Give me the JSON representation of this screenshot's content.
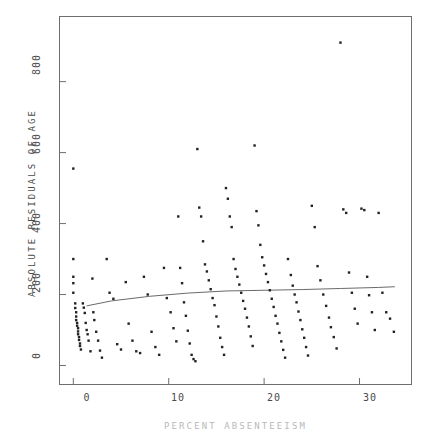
{
  "figure": {
    "background_color": "#ffffff",
    "foreground_color": "#3a3a3a",
    "frame_color": "#6e6e6e"
  },
  "axis_titles": {
    "y": "ABSOLUTE  RESIDUALS  OF  AGE",
    "x": "PERCENT  ABSENTEEISM"
  },
  "ticks": {
    "y_labels": [
      "0",
      "200",
      "400",
      "600",
      "800"
    ],
    "x_labels": [
      "0",
      "10",
      "20",
      "30"
    ]
  },
  "chart_data": {
    "type": "scatter",
    "title": "",
    "xlabel": "PERCENT  ABSENTEEISM",
    "ylabel": "ABSOLUTE  RESIDUALS  OF  AGE",
    "xlim": [
      -1.5,
      35.5
    ],
    "ylim": [
      -55,
      985
    ],
    "xticks": [
      0,
      10,
      20,
      30
    ],
    "yticks": [
      0,
      200,
      400,
      600,
      800
    ],
    "grid": false,
    "legend": null,
    "marker": "square",
    "marker_color": "#222222",
    "marker_size_px": 2.4,
    "series": [
      {
        "name": "Absolute residuals",
        "points": [
          [
            0.0,
            555
          ],
          [
            0.0,
            300
          ],
          [
            0.0,
            250
          ],
          [
            0.0,
            232
          ],
          [
            0.0,
            205
          ],
          [
            0.2,
            175
          ],
          [
            0.2,
            162
          ],
          [
            0.3,
            150
          ],
          [
            0.3,
            138
          ],
          [
            0.3,
            128
          ],
          [
            0.4,
            120
          ],
          [
            0.4,
            112
          ],
          [
            0.5,
            105
          ],
          [
            0.5,
            96
          ],
          [
            0.5,
            88
          ],
          [
            0.6,
            80
          ],
          [
            0.6,
            72
          ],
          [
            0.7,
            62
          ],
          [
            0.7,
            55
          ],
          [
            0.8,
            45
          ],
          [
            1.0,
            175
          ],
          [
            1.1,
            163
          ],
          [
            1.2,
            148
          ],
          [
            1.3,
            120
          ],
          [
            1.4,
            100
          ],
          [
            1.5,
            88
          ],
          [
            1.6,
            70
          ],
          [
            1.8,
            40
          ],
          [
            2.0,
            245
          ],
          [
            2.1,
            150
          ],
          [
            2.2,
            128
          ],
          [
            2.4,
            95
          ],
          [
            2.6,
            70
          ],
          [
            2.8,
            42
          ],
          [
            3.0,
            22
          ],
          [
            3.5,
            300
          ],
          [
            3.8,
            205
          ],
          [
            4.2,
            188
          ],
          [
            4.6,
            60
          ],
          [
            5.0,
            45
          ],
          [
            5.5,
            235
          ],
          [
            5.8,
            118
          ],
          [
            6.2,
            70
          ],
          [
            6.6,
            40
          ],
          [
            7.0,
            35
          ],
          [
            7.4,
            250
          ],
          [
            7.8,
            200
          ],
          [
            8.2,
            95
          ],
          [
            8.6,
            52
          ],
          [
            9.0,
            30
          ],
          [
            9.5,
            275
          ],
          [
            9.8,
            190
          ],
          [
            10.2,
            150
          ],
          [
            10.5,
            105
          ],
          [
            10.8,
            68
          ],
          [
            11.0,
            420
          ],
          [
            11.2,
            275
          ],
          [
            11.4,
            232
          ],
          [
            11.6,
            178
          ],
          [
            11.8,
            140
          ],
          [
            12.0,
            98
          ],
          [
            12.2,
            62
          ],
          [
            12.4,
            30
          ],
          [
            12.6,
            18
          ],
          [
            12.8,
            12
          ],
          [
            13.0,
            610
          ],
          [
            13.2,
            445
          ],
          [
            13.4,
            420
          ],
          [
            13.6,
            350
          ],
          [
            13.8,
            285
          ],
          [
            14.0,
            265
          ],
          [
            14.2,
            240
          ],
          [
            14.4,
            215
          ],
          [
            14.6,
            190
          ],
          [
            14.8,
            170
          ],
          [
            15.0,
            138
          ],
          [
            15.2,
            110
          ],
          [
            15.4,
            78
          ],
          [
            15.6,
            52
          ],
          [
            15.8,
            30
          ],
          [
            16.0,
            500
          ],
          [
            16.2,
            470
          ],
          [
            16.4,
            420
          ],
          [
            16.6,
            390
          ],
          [
            16.8,
            300
          ],
          [
            17.0,
            272
          ],
          [
            17.2,
            250
          ],
          [
            17.4,
            228
          ],
          [
            17.6,
            205
          ],
          [
            17.8,
            182
          ],
          [
            18.0,
            160
          ],
          [
            18.2,
            135
          ],
          [
            18.4,
            110
          ],
          [
            18.6,
            82
          ],
          [
            18.8,
            55
          ],
          [
            19.0,
            620
          ],
          [
            19.2,
            435
          ],
          [
            19.4,
            395
          ],
          [
            19.6,
            340
          ],
          [
            19.8,
            305
          ],
          [
            20.0,
            282
          ],
          [
            20.2,
            258
          ],
          [
            20.4,
            235
          ],
          [
            20.6,
            212
          ],
          [
            20.8,
            188
          ],
          [
            21.0,
            165
          ],
          [
            21.2,
            140
          ],
          [
            21.4,
            118
          ],
          [
            21.6,
            92
          ],
          [
            21.8,
            68
          ],
          [
            22.0,
            44
          ],
          [
            22.2,
            22
          ],
          [
            22.5,
            300
          ],
          [
            22.8,
            255
          ],
          [
            23.0,
            225
          ],
          [
            23.2,
            200
          ],
          [
            23.4,
            178
          ],
          [
            23.6,
            152
          ],
          [
            23.8,
            128
          ],
          [
            24.0,
            102
          ],
          [
            24.2,
            78
          ],
          [
            24.4,
            52
          ],
          [
            24.6,
            28
          ],
          [
            25.0,
            450
          ],
          [
            25.3,
            390
          ],
          [
            25.6,
            280
          ],
          [
            25.9,
            240
          ],
          [
            26.2,
            200
          ],
          [
            26.5,
            168
          ],
          [
            26.8,
            135
          ],
          [
            27.0,
            108
          ],
          [
            27.3,
            80
          ],
          [
            27.6,
            48
          ],
          [
            28.0,
            910
          ],
          [
            28.3,
            440
          ],
          [
            28.6,
            430
          ],
          [
            28.9,
            262
          ],
          [
            29.2,
            205
          ],
          [
            29.5,
            160
          ],
          [
            29.8,
            118
          ],
          [
            30.2,
            442
          ],
          [
            30.5,
            438
          ],
          [
            30.8,
            250
          ],
          [
            31.0,
            198
          ],
          [
            31.3,
            150
          ],
          [
            31.6,
            100
          ],
          [
            32.0,
            430
          ],
          [
            32.4,
            205
          ],
          [
            32.8,
            150
          ],
          [
            33.2,
            132
          ],
          [
            33.6,
            95
          ]
        ]
      }
    ],
    "trend_line": {
      "name": "lowess-fit",
      "color": "#6a6a6a",
      "points": [
        [
          1.4,
          168
        ],
        [
          4.0,
          182
        ],
        [
          8.0,
          195
        ],
        [
          12.0,
          204
        ],
        [
          16.0,
          210
        ],
        [
          20.0,
          212
        ],
        [
          24.0,
          214
        ],
        [
          28.0,
          217
        ],
        [
          32.0,
          220
        ],
        [
          33.7,
          222
        ]
      ]
    }
  }
}
